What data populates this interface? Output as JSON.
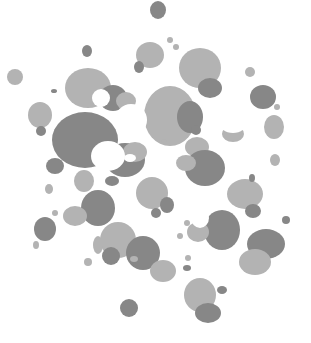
{
  "canvas": {
    "width": 311,
    "height": 343,
    "background": "#ffffff",
    "colors": {
      "light": "#b3b3b3",
      "dark": "#878787",
      "white": "#ffffff"
    }
  },
  "blobs": [
    {
      "cx": 158,
      "cy": 10,
      "rx": 8,
      "ry": 9,
      "tone": "dark"
    },
    {
      "cx": 15,
      "cy": 77,
      "rx": 8,
      "ry": 8,
      "tone": "light"
    },
    {
      "cx": 87,
      "cy": 51,
      "rx": 5,
      "ry": 6,
      "tone": "dark"
    },
    {
      "cx": 150,
      "cy": 55,
      "rx": 14,
      "ry": 13,
      "tone": "light"
    },
    {
      "cx": 139,
      "cy": 67,
      "rx": 5,
      "ry": 6,
      "tone": "dark"
    },
    {
      "cx": 170,
      "cy": 40,
      "rx": 3,
      "ry": 3,
      "tone": "light"
    },
    {
      "cx": 176,
      "cy": 47,
      "rx": 3,
      "ry": 3,
      "tone": "light"
    },
    {
      "cx": 200,
      "cy": 68,
      "rx": 21,
      "ry": 20,
      "tone": "light"
    },
    {
      "cx": 210,
      "cy": 88,
      "rx": 12,
      "ry": 10,
      "tone": "dark"
    },
    {
      "cx": 250,
      "cy": 72,
      "rx": 5,
      "ry": 5,
      "tone": "light"
    },
    {
      "cx": 263,
      "cy": 97,
      "rx": 13,
      "ry": 12,
      "tone": "dark"
    },
    {
      "cx": 277,
      "cy": 107,
      "rx": 3,
      "ry": 3,
      "tone": "light"
    },
    {
      "cx": 274,
      "cy": 127,
      "rx": 10,
      "ry": 12,
      "tone": "light"
    },
    {
      "cx": 275,
      "cy": 160,
      "rx": 5,
      "ry": 6,
      "tone": "light"
    },
    {
      "cx": 88,
      "cy": 88,
      "rx": 23,
      "ry": 20,
      "tone": "light"
    },
    {
      "cx": 113,
      "cy": 98,
      "rx": 14,
      "ry": 13,
      "tone": "dark"
    },
    {
      "cx": 126,
      "cy": 101,
      "rx": 10,
      "ry": 9,
      "tone": "light"
    },
    {
      "cx": 54,
      "cy": 91,
      "rx": 3,
      "ry": 2,
      "tone": "dark"
    },
    {
      "cx": 40,
      "cy": 115,
      "rx": 12,
      "ry": 13,
      "tone": "light"
    },
    {
      "cx": 41,
      "cy": 131,
      "rx": 5,
      "ry": 5,
      "tone": "dark"
    },
    {
      "cx": 85,
      "cy": 140,
      "rx": 33,
      "ry": 28,
      "tone": "dark"
    },
    {
      "cx": 55,
      "cy": 166,
      "rx": 9,
      "ry": 8,
      "tone": "dark"
    },
    {
      "cx": 125,
      "cy": 160,
      "rx": 20,
      "ry": 17,
      "tone": "dark"
    },
    {
      "cx": 135,
      "cy": 152,
      "rx": 12,
      "ry": 10,
      "tone": "light"
    },
    {
      "cx": 170,
      "cy": 116,
      "rx": 26,
      "ry": 30,
      "tone": "light"
    },
    {
      "cx": 190,
      "cy": 117,
      "rx": 13,
      "ry": 16,
      "tone": "dark"
    },
    {
      "cx": 196,
      "cy": 130,
      "rx": 5,
      "ry": 5,
      "tone": "dark"
    },
    {
      "cx": 233,
      "cy": 134,
      "rx": 11,
      "ry": 8,
      "tone": "light"
    },
    {
      "cx": 197,
      "cy": 147,
      "rx": 12,
      "ry": 10,
      "tone": "light"
    },
    {
      "cx": 205,
      "cy": 168,
      "rx": 20,
      "ry": 18,
      "tone": "dark"
    },
    {
      "cx": 186,
      "cy": 163,
      "rx": 10,
      "ry": 8,
      "tone": "light"
    },
    {
      "cx": 164,
      "cy": 141,
      "rx": 3,
      "ry": 2,
      "tone": "light"
    },
    {
      "cx": 84,
      "cy": 181,
      "rx": 10,
      "ry": 11,
      "tone": "light"
    },
    {
      "cx": 112,
      "cy": 181,
      "rx": 7,
      "ry": 5,
      "tone": "dark"
    },
    {
      "cx": 49,
      "cy": 189,
      "rx": 4,
      "ry": 5,
      "tone": "light"
    },
    {
      "cx": 55,
      "cy": 213,
      "rx": 3,
      "ry": 3,
      "tone": "light"
    },
    {
      "cx": 98,
      "cy": 208,
      "rx": 17,
      "ry": 18,
      "tone": "dark"
    },
    {
      "cx": 75,
      "cy": 216,
      "rx": 12,
      "ry": 10,
      "tone": "light"
    },
    {
      "cx": 45,
      "cy": 229,
      "rx": 11,
      "ry": 12,
      "tone": "dark"
    },
    {
      "cx": 36,
      "cy": 245,
      "rx": 3,
      "ry": 4,
      "tone": "light"
    },
    {
      "cx": 152,
      "cy": 193,
      "rx": 16,
      "ry": 16,
      "tone": "light"
    },
    {
      "cx": 167,
      "cy": 205,
      "rx": 7,
      "ry": 8,
      "tone": "dark"
    },
    {
      "cx": 156,
      "cy": 213,
      "rx": 5,
      "ry": 5,
      "tone": "dark"
    },
    {
      "cx": 245,
      "cy": 194,
      "rx": 18,
      "ry": 15,
      "tone": "light"
    },
    {
      "cx": 253,
      "cy": 211,
      "rx": 8,
      "ry": 7,
      "tone": "dark"
    },
    {
      "cx": 222,
      "cy": 230,
      "rx": 18,
      "ry": 20,
      "tone": "dark"
    },
    {
      "cx": 198,
      "cy": 232,
      "rx": 11,
      "ry": 10,
      "tone": "light"
    },
    {
      "cx": 187,
      "cy": 223,
      "rx": 3,
      "ry": 3,
      "tone": "light"
    },
    {
      "cx": 286,
      "cy": 220,
      "rx": 4,
      "ry": 4,
      "tone": "dark"
    },
    {
      "cx": 266,
      "cy": 244,
      "rx": 19,
      "ry": 15,
      "tone": "dark"
    },
    {
      "cx": 255,
      "cy": 262,
      "rx": 16,
      "ry": 13,
      "tone": "light"
    },
    {
      "cx": 180,
      "cy": 236,
      "rx": 3,
      "ry": 3,
      "tone": "light"
    },
    {
      "cx": 188,
      "cy": 258,
      "rx": 3,
      "ry": 3,
      "tone": "light"
    },
    {
      "cx": 187,
      "cy": 268,
      "rx": 4,
      "ry": 3,
      "tone": "dark"
    },
    {
      "cx": 118,
      "cy": 240,
      "rx": 18,
      "ry": 18,
      "tone": "light"
    },
    {
      "cx": 111,
      "cy": 256,
      "rx": 9,
      "ry": 9,
      "tone": "dark"
    },
    {
      "cx": 143,
      "cy": 253,
      "rx": 17,
      "ry": 17,
      "tone": "dark"
    },
    {
      "cx": 134,
      "cy": 259,
      "rx": 4,
      "ry": 3,
      "tone": "light"
    },
    {
      "cx": 163,
      "cy": 271,
      "rx": 13,
      "ry": 11,
      "tone": "light"
    },
    {
      "cx": 98,
      "cy": 245,
      "rx": 5,
      "ry": 9,
      "tone": "light"
    },
    {
      "cx": 88,
      "cy": 262,
      "rx": 4,
      "ry": 4,
      "tone": "light"
    },
    {
      "cx": 200,
      "cy": 295,
      "rx": 16,
      "ry": 17,
      "tone": "light"
    },
    {
      "cx": 208,
      "cy": 313,
      "rx": 13,
      "ry": 10,
      "tone": "dark"
    },
    {
      "cx": 222,
      "cy": 290,
      "rx": 5,
      "ry": 4,
      "tone": "dark"
    },
    {
      "cx": 129,
      "cy": 308,
      "rx": 9,
      "ry": 9,
      "tone": "dark"
    },
    {
      "cx": 252,
      "cy": 178,
      "rx": 3,
      "ry": 4,
      "tone": "dark"
    }
  ],
  "holes": [
    {
      "cx": 101,
      "cy": 98,
      "rx": 9,
      "ry": 9
    },
    {
      "cx": 108,
      "cy": 156,
      "rx": 17,
      "ry": 15
    },
    {
      "cx": 130,
      "cy": 158,
      "rx": 6,
      "ry": 4
    },
    {
      "cx": 131,
      "cy": 120,
      "rx": 16,
      "ry": 16
    },
    {
      "cx": 233,
      "cy": 122,
      "rx": 14,
      "ry": 11
    },
    {
      "cx": 200,
      "cy": 218,
      "rx": 9,
      "ry": 10
    }
  ]
}
